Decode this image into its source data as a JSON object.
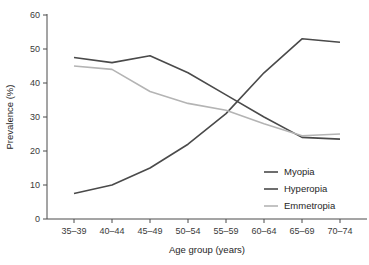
{
  "chart_data": {
    "type": "line",
    "title": "",
    "xlabel": "Age group (years)",
    "ylabel": "Prevalence (%)",
    "categories": [
      "35–39",
      "40–44",
      "45–49",
      "50–54",
      "55–59",
      "60–64",
      "65–69",
      "70–74"
    ],
    "ylim": [
      0,
      60
    ],
    "yticks": [
      0,
      10,
      20,
      30,
      40,
      50,
      60
    ],
    "ytick_labels": [
      "0",
      "10",
      "20",
      "30",
      "40",
      "50",
      "60"
    ],
    "grid": false,
    "legend_position": "lower-right",
    "series": [
      {
        "name": "Myopia",
        "color": "#4a4a4a",
        "values": [
          7.5,
          10.0,
          15.0,
          22.0,
          31.0,
          43.0,
          53.0,
          52.0
        ]
      },
      {
        "name": "Hyperopia",
        "color": "#4a4a4a",
        "values": [
          47.5,
          46.0,
          48.0,
          43.0,
          36.5,
          30.0,
          24.0,
          23.5
        ]
      },
      {
        "name": "Emmetropia",
        "color": "#b4b4b4",
        "values": [
          45.0,
          44.0,
          37.5,
          34.0,
          32.0,
          28.0,
          24.5,
          25.0
        ]
      }
    ]
  },
  "legend": {
    "entries": [
      {
        "label": "Myopia"
      },
      {
        "label": "Hyperopia"
      },
      {
        "label": "Emmetropia"
      }
    ]
  }
}
